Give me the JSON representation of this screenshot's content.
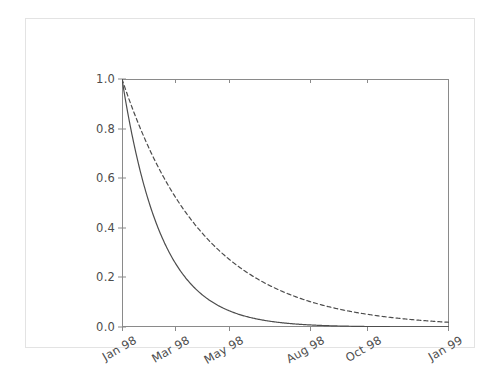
{
  "figure": {
    "title": "",
    "background_color": "#ffffff",
    "frame_color": "#e3e3e3",
    "axis_color": "#8a8a8a",
    "tick_label_color": "#4d4d4d"
  },
  "chart_data": {
    "type": "line",
    "title": "",
    "subtitle": "",
    "xlabel": "",
    "ylabel": "",
    "grid": false,
    "legend": null,
    "legend_position": "none",
    "xlim": [
      "Jan 98",
      "Jan 99"
    ],
    "ylim": [
      0.0,
      1.0
    ],
    "ytick_labels": [
      "0.0",
      "0.2",
      "0.4",
      "0.6",
      "0.8",
      "1.0"
    ],
    "ytick_values": [
      0.0,
      0.2,
      0.4,
      0.6,
      0.8,
      1.0
    ],
    "xtick_labels": [
      "Jan 98",
      "Mar 98",
      "May 98",
      "Aug 98",
      "Oct 98",
      "Jan 99"
    ],
    "xtick_fractions": [
      0.0,
      0.161,
      0.326,
      0.576,
      0.748,
      1.0
    ],
    "xtick_rotation_degrees": -30,
    "x_months": [
      0,
      1,
      2,
      3,
      4,
      5,
      6,
      7,
      8,
      9,
      10,
      11,
      12
    ],
    "series": [
      {
        "name": "fast-decay",
        "style": "solid",
        "color": "#4d4d4d",
        "line_width": 1.2,
        "half_life_months": 1.0,
        "values": [
          1.0,
          0.5,
          0.25,
          0.125,
          0.0625,
          0.0313,
          0.0156,
          0.0078,
          0.0039,
          0.002,
          0.001,
          0.0005,
          0.0002
        ]
      },
      {
        "name": "slow-decay",
        "style": "dashed",
        "color": "#4d4d4d",
        "line_width": 1.2,
        "dash_pattern": "4,3",
        "half_life_months": 2.1,
        "values": [
          1.0,
          0.721,
          0.52,
          0.375,
          0.27,
          0.195,
          0.141,
          0.101,
          0.073,
          0.053,
          0.038,
          0.027,
          0.02
        ]
      }
    ]
  }
}
